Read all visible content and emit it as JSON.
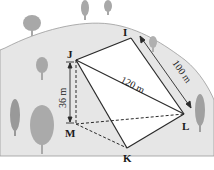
{
  "diagram": {
    "points": {
      "I": {
        "label": "I",
        "x": 131,
        "y": 38
      },
      "J": {
        "label": "J",
        "x": 76,
        "y": 60
      },
      "L": {
        "label": "L",
        "x": 184,
        "y": 114
      },
      "M": {
        "label": "M",
        "x": 76,
        "y": 124
      },
      "K": {
        "label": "K",
        "x": 127,
        "y": 148
      }
    },
    "measurements": {
      "IL": "100 m",
      "JL": "120 m",
      "JM": "36 m"
    },
    "colors": {
      "hill": "#e6e6e6",
      "hill_edge": "#9a9a9a",
      "tree": "#a8a8a8",
      "line": "#2a2a2a",
      "face": "#ffffff"
    }
  }
}
